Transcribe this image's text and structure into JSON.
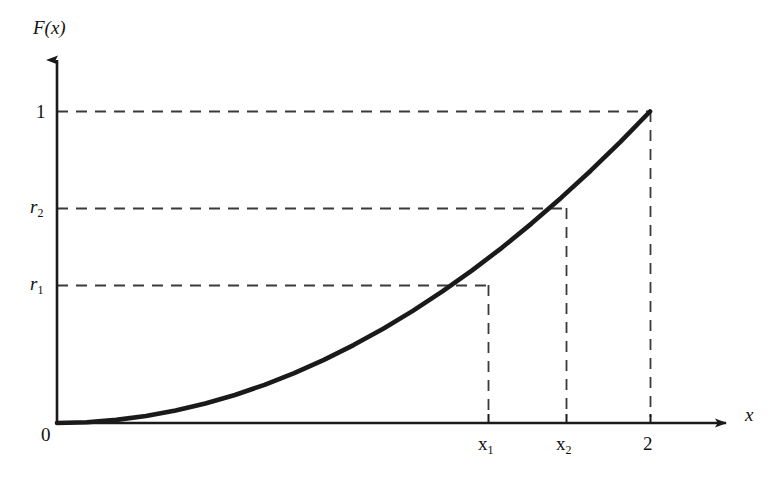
{
  "figure": {
    "background": "#ffffff",
    "line_color": "#1a1a1a",
    "dash_color": "#3a3a3a"
  },
  "labels": {
    "y_axis": "F(x)",
    "x_axis": "x",
    "origin": "0",
    "y_one": "1",
    "y_r2_base": "r",
    "y_r2_sub": "2",
    "y_r1_base": "r",
    "y_r1_sub": "1",
    "x_x1_base": "x",
    "x_x1_sub": "1",
    "x_x2_base": "x",
    "x_x2_sub": "2",
    "x_two": "2"
  },
  "chart_data": {
    "type": "line",
    "title": "",
    "xlabel": "x",
    "ylabel": "F(x)",
    "xlim": [
      0,
      2.35
    ],
    "ylim": [
      0,
      1.18
    ],
    "grid": false,
    "legend": null,
    "series": [
      {
        "name": "F(x) = x^2 / 4",
        "x": [
          0.0,
          0.1,
          0.2,
          0.3,
          0.4,
          0.5,
          0.6,
          0.7,
          0.8,
          0.9,
          1.0,
          1.1,
          1.2,
          1.3,
          1.4,
          1.5,
          1.6,
          1.7,
          1.8,
          1.9,
          2.0
        ],
        "y": [
          0.0,
          0.0025,
          0.01,
          0.0225,
          0.04,
          0.0625,
          0.09,
          0.1225,
          0.16,
          0.2025,
          0.25,
          0.3025,
          0.36,
          0.4225,
          0.49,
          0.5625,
          0.64,
          0.7225,
          0.81,
          0.9025,
          1.0
        ]
      }
    ],
    "x_ticks": [
      {
        "value": 0,
        "label": "0"
      },
      {
        "value": 1.45,
        "label": "x1"
      },
      {
        "value": 1.71,
        "label": "x2"
      },
      {
        "value": 2.0,
        "label": "2"
      }
    ],
    "y_ticks": [
      {
        "value": 0.36,
        "label": "r1"
      },
      {
        "value": 0.63,
        "label": "r2"
      },
      {
        "value": 1.0,
        "label": "1"
      }
    ],
    "annotations": [
      {
        "type": "dashed-guide",
        "from": [
          0,
          1.0
        ],
        "to": [
          2.0,
          1.0
        ],
        "orientation": "horizontal"
      },
      {
        "type": "dashed-guide",
        "from": [
          0,
          0.63
        ],
        "to": [
          1.71,
          0.63
        ],
        "orientation": "horizontal"
      },
      {
        "type": "dashed-guide",
        "from": [
          0,
          0.36
        ],
        "to": [
          1.45,
          0.36
        ],
        "orientation": "horizontal"
      },
      {
        "type": "dashed-guide",
        "from": [
          2.0,
          0
        ],
        "to": [
          2.0,
          1.0
        ],
        "orientation": "vertical"
      },
      {
        "type": "dashed-guide",
        "from": [
          1.71,
          0
        ],
        "to": [
          1.71,
          0.63
        ],
        "orientation": "vertical"
      },
      {
        "type": "dashed-guide",
        "from": [
          1.45,
          0
        ],
        "to": [
          1.45,
          0.36
        ],
        "orientation": "vertical"
      }
    ]
  }
}
